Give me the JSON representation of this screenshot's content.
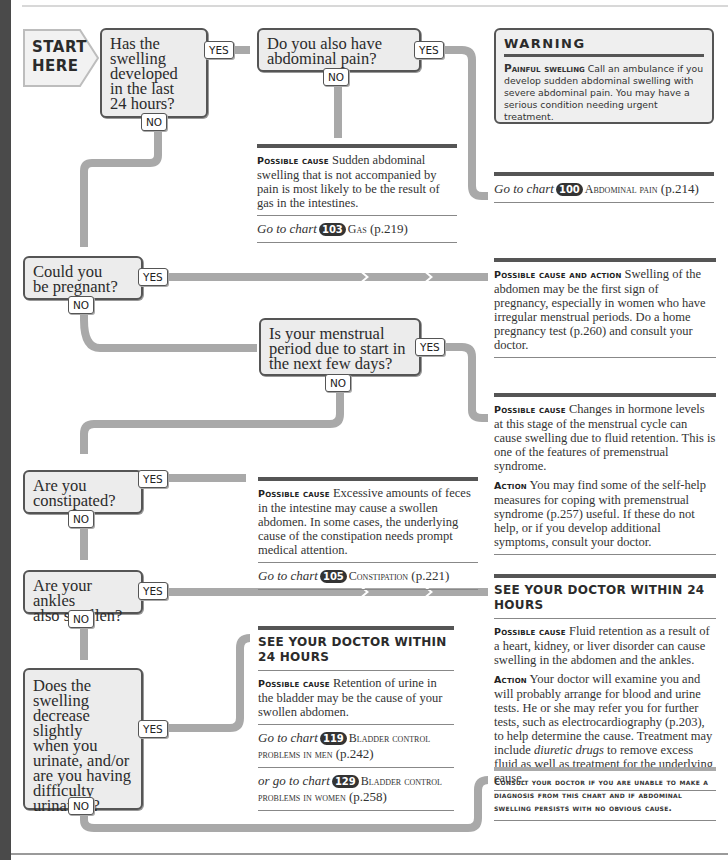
{
  "start": {
    "line1": "START",
    "line2": "HERE"
  },
  "tags": {
    "yes": "YES",
    "no": "NO"
  },
  "questions": [
    {
      "id": "q1",
      "lines": [
        "Has the",
        "swelling",
        "developed",
        "in the last",
        "24 hours?"
      ]
    },
    {
      "id": "q2",
      "lines": [
        "Do you also have",
        "abdominal pain?"
      ]
    },
    {
      "id": "q3",
      "lines": [
        "Could you",
        "be pregnant?"
      ]
    },
    {
      "id": "q4",
      "lines": [
        "Is your menstrual",
        "period due to start in",
        "the next few days?"
      ]
    },
    {
      "id": "q5",
      "lines": [
        "Are you",
        "constipated?"
      ]
    },
    {
      "id": "q6",
      "lines": [
        "Are your ankles",
        "also swollen?"
      ]
    },
    {
      "id": "q7",
      "lines": [
        "Does the",
        "swelling",
        "decrease slightly",
        "when you",
        "urinate, and/or",
        "are you having",
        "difficulty",
        "urinating?"
      ]
    }
  ],
  "warning": {
    "title": "WARNING",
    "label": "Painful swelling",
    "text": "Call an ambulance if you develop sudden abdominal swelling with severe abdominal pain. You may have a serious condition needing urgent treatment."
  },
  "panels": {
    "gas": {
      "label": "Possible cause",
      "text": "Sudden abdominal swelling that is not accompanied by pain is most likely to be the result of gas in the intestines.",
      "goto": {
        "prefix": "Go to chart",
        "chart": "103",
        "title": "Gas",
        "page": "(p.219)"
      }
    },
    "abdominal_pain": {
      "goto": {
        "prefix": "Go to chart",
        "chart": "100",
        "title": "Abdominal pain",
        "page": "(p.214)"
      }
    },
    "pregnancy": {
      "label": "Possible cause and action",
      "text": "Swelling of the abdomen may be the first sign of pregnancy, especially in women who have irregular menstrual periods. Do a home pregnancy test (p.260) and consult your doctor."
    },
    "premenstrual": {
      "label": "Possible cause",
      "text": "Changes in hormone levels at this stage of the menstrual cycle can cause swelling due to fluid retention. This is one of the features of premenstrual syndrome.",
      "action_label": "Action",
      "action_text": "You may find some of the self-help measures for coping with premenstrual syndrome (p.257) useful. If these do not help, or if you develop additional symptoms, consult your doctor."
    },
    "constipation": {
      "label": "Possible cause",
      "text": "Excessive amounts of feces in the intestine may cause a swollen abdomen. In some cases, the underlying cause of the constipation needs prompt medical attention.",
      "goto": {
        "prefix": "Go to chart",
        "chart": "105",
        "title": "Constipation",
        "page": "(p.221)"
      }
    },
    "ankles": {
      "heading": "SEE YOUR DOCTOR WITHIN 24 HOURS",
      "label": "Possible cause",
      "text": "Fluid retention as a result of a heart, kidney, or liver disorder can cause swelling in the abdomen and the ankles.",
      "action_label": "Action",
      "action_text_1": "Your doctor will examine you and will probably arrange for blood and urine tests. He or she may refer you for further tests, such as electrocardiography (p.203), to help determine the cause. Treatment may include",
      "action_italic": "diuretic drugs",
      "action_text_2": "to remove excess fluid as well as treatment for the underlying cause."
    },
    "urine": {
      "heading": "SEE YOUR DOCTOR WITHIN 24 HOURS",
      "label": "Possible cause",
      "text": "Retention of urine in the bladder may be the cause of your swollen abdomen.",
      "goto1": {
        "prefix": "Go to chart",
        "chart": "119",
        "title": "Bladder control problems in men",
        "page": "(p.242)"
      },
      "goto2": {
        "prefix": "or go to chart",
        "chart": "129",
        "title": "Bladder control problems in women",
        "page": "(p.258)"
      }
    },
    "consult": {
      "text": "Consult your doctor if you are unable to make a diagnosis from this chart and if abdominal swelling persists with no obvious cause."
    }
  },
  "colors": {
    "connector": "#a9a9a9",
    "box_fill": "#ececec",
    "box_border": "#555555",
    "badge": "#333333"
  }
}
